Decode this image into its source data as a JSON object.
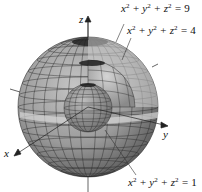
{
  "diagram": {
    "type": "nested-spheres-cutaway",
    "axes": {
      "z": {
        "label": "z"
      },
      "y": {
        "label": "y"
      },
      "x": {
        "label": "x"
      }
    },
    "surfaces": [
      {
        "id": "outer",
        "equation": "x² + y² + z² = 9",
        "lhs": "x",
        "rhs": "9",
        "radius_units": 3
      },
      {
        "id": "middle",
        "equation": "x² + y² + z² = 4",
        "lhs": "x",
        "rhs": "4",
        "radius_units": 2
      },
      {
        "id": "inner",
        "equation": "x² + y² + z² = 1",
        "lhs": "x",
        "rhs": "1",
        "radius_units": 1
      }
    ],
    "colors": {
      "sphere_fill": "#9a9a9a",
      "sphere_dark": "#4a4a4a",
      "cutaway_light": "#d8d8d8",
      "grid_line": "#2a2a2a",
      "axis": "#222222",
      "background": "#ffffff"
    }
  }
}
